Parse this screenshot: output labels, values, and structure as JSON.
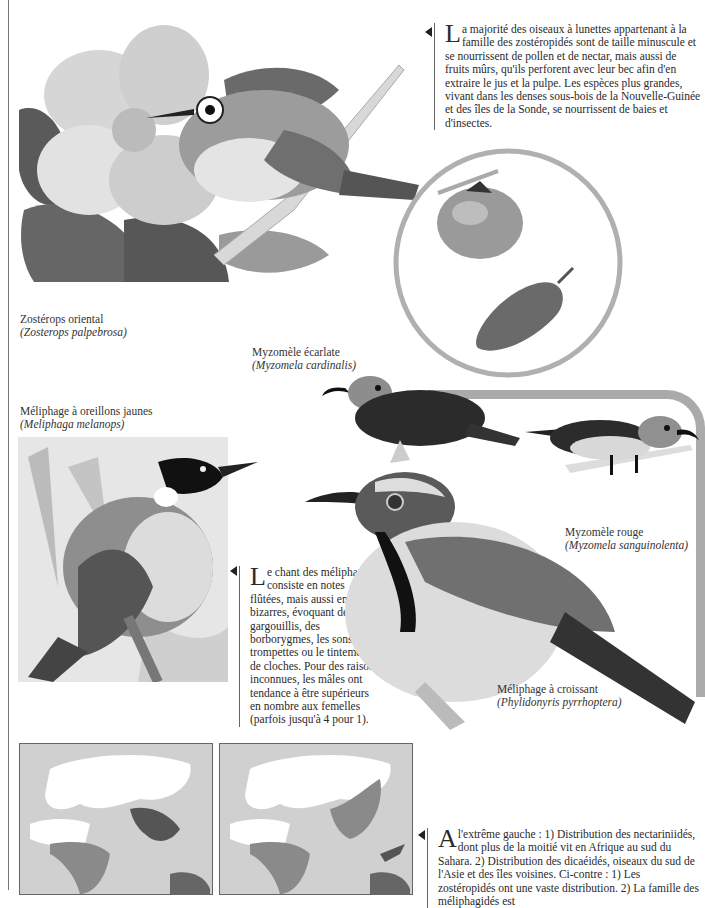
{
  "page": {
    "palette": {
      "ink": "#222222",
      "frame_gray": "#aaaaaa",
      "map_sea": "#d0d0d0",
      "map_land": "#ffffff",
      "map_range": "#8a8a8a"
    }
  },
  "paragraphs": {
    "zosteropides": {
      "dropcap": "L",
      "text": "a majorité des oiseaux à lunettes appartenant à la famille des zostéropidés sont de taille minuscule et se nourrissent de pollen et de nectar, mais aussi de fruits mûrs, qu'ils perforent avec leur bec afin d'en extraire le jus et la pulpe. Les espèces plus grandes, vivant dans les denses sous-bois de la Nouvelle-Guinée et des îles de la Sonde, se nourrissent de baies et d'insectes."
    },
    "meliphages": {
      "dropcap": "L",
      "text": "e chant des méliphages consiste en notes flûtées, mais aussi en cris bizarres, évoquant des gargouillis, des borborygmes, les sons de trompettes ou le tintement de cloches. Pour des raisons inconnues, les mâles ont tendance à être supérieurs en nombre aux femelles (parfois jusqu'à 4 pour 1)."
    },
    "maps": {
      "dropcap": "A",
      "text": " l'extrême gauche : 1) Distribution des nectariniidés, dont plus de la moitié vit en Afrique au sud du Sahara. 2) Distribution des dicaéidés, oiseaux du sud de l'Asie et des îles voisines. Ci-contre : 1) Les zostéropidés ont une vaste distribution. 2) La famille des méliphagidés est"
    }
  },
  "captions": {
    "zosterops": {
      "common": "Zostérops oriental",
      "scientific": "(Zosterops palpebrosa)"
    },
    "myzomele_ecarlate": {
      "common": "Myzomèle écarlate",
      "scientific": "(Myzomela cardinalis)"
    },
    "meliphage_oreillons": {
      "common": "Méliphage à oreillons jaunes",
      "scientific": "(Meliphaga melanops)"
    },
    "myzomele_rouge": {
      "common": "Myzomèle rouge",
      "scientific": "(Myzomela sanguinolenta)"
    },
    "meliphage_croissant": {
      "common": "Méliphage à croissant",
      "scientific": "(Phylidonyris pyrrhoptera)"
    }
  },
  "illustrations": [
    {
      "id": "zosterops-flower",
      "subject": "Zostérops oriental sur fleur d'hibiscus"
    },
    {
      "id": "fruit-inset",
      "subject": "fruits : kaki et mûre"
    },
    {
      "id": "myzomela-cardinalis",
      "subject": "Myzomèle écarlate"
    },
    {
      "id": "myzomela-sanguinolenta",
      "subject": "Myzomèle rouge"
    },
    {
      "id": "meliphaga-melanops",
      "subject": "Méliphage à oreillons jaunes"
    },
    {
      "id": "phylidonyris",
      "subject": "Méliphage à croissant"
    },
    {
      "id": "map-1",
      "subject": "Carte de distribution 1"
    },
    {
      "id": "map-2",
      "subject": "Carte de distribution 2"
    }
  ]
}
